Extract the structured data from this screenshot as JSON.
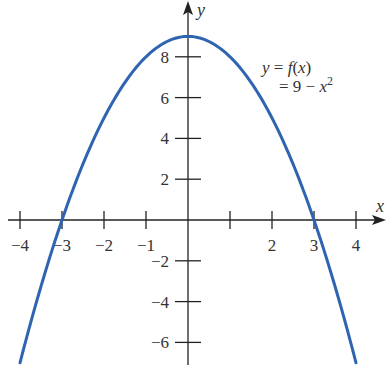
{
  "chart_data": {
    "type": "line",
    "title": "",
    "xlabel": "x",
    "ylabel": "y",
    "xlim": [
      -4.5,
      4.6
    ],
    "ylim": [
      -7,
      9.5
    ],
    "grid": false,
    "x_ticks": [
      -4,
      -3,
      -2,
      -1,
      1,
      2,
      3,
      4
    ],
    "x_tick_labels": [
      "−4",
      "−3",
      "−2",
      "−1",
      "",
      "2",
      "3",
      "4"
    ],
    "y_ticks": [
      8,
      6,
      4,
      2,
      -2,
      -4,
      -6
    ],
    "y_tick_labels": [
      "8",
      "6",
      "4",
      "2",
      "−2",
      "−4",
      "−6"
    ],
    "series": [
      {
        "name": "f(x) = 9 − x²",
        "color": "#2e64b0",
        "function": "9 - x^2",
        "x": [
          -4,
          -3.5,
          -3,
          -2.5,
          -2,
          -1.5,
          -1,
          -0.5,
          0,
          0.5,
          1,
          1.5,
          2,
          2.5,
          3,
          3.5,
          4
        ],
        "y": [
          -7,
          -3.25,
          0,
          2.75,
          5,
          6.75,
          8,
          8.75,
          9,
          8.75,
          8,
          6.75,
          5,
          2.75,
          0,
          -3.25,
          -7
        ]
      }
    ],
    "annotations": [
      {
        "text_line1": "y = f(x)",
        "text_line2": "= 9 − x²",
        "x": 1.8,
        "y": 7.8
      }
    ],
    "key_points": {
      "vertex": [
        0,
        9
      ],
      "x_intercepts": [
        -3,
        3
      ]
    }
  },
  "labels": {
    "x_axis": "x",
    "y_axis": "y",
    "eq_line1_y": "y",
    "eq_line1_eq": " = ",
    "eq_line1_f": "f",
    "eq_line1_paren": "(",
    "eq_line1_x": "x",
    "eq_line1_close": ")",
    "eq_line2_pre": "= 9 − ",
    "eq_line2_x": "x",
    "eq_line2_exp": "2"
  },
  "colors": {
    "curve": "#2e64b0",
    "axes": "#222222",
    "text": "#333333"
  }
}
